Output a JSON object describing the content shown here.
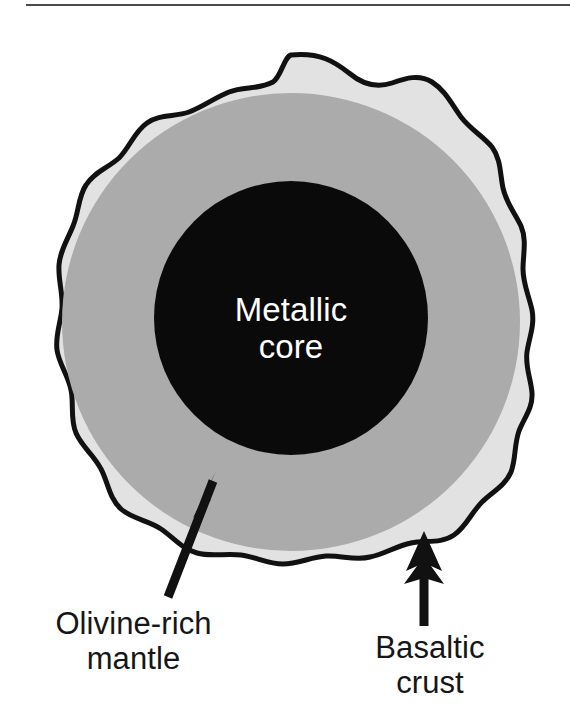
{
  "figure": {
    "kind": "cross-section-diagram",
    "background_color": "#ffffff",
    "top_rule": {
      "name": "horizontal-rule",
      "color": "#4a4a4a",
      "x": 26,
      "y": 4,
      "width": 544,
      "thickness": 2
    },
    "layers": [
      {
        "id": "crust",
        "name": "Basaltic crust",
        "fill_color": "#e2e2e2",
        "outline_color": "#111111",
        "outline_width": 5,
        "shape": "irregular-lumpy-blob",
        "order": 1
      },
      {
        "id": "mantle",
        "name": "Olivine-rich mantle",
        "fill_color": "#ababab",
        "shape": "circle",
        "center_x": 291,
        "center_y": 322,
        "radius": 229,
        "order": 2
      },
      {
        "id": "core",
        "name": "Metallic core",
        "fill_color": "#0a0a0a",
        "shape": "circle",
        "center_x": 291,
        "center_y": 318,
        "radius": 137,
        "order": 3
      }
    ],
    "labels": {
      "core": {
        "text": "Metallic\ncore",
        "line1": "Metallic",
        "line2": "core",
        "color": "#ffffff",
        "font_size": 33,
        "align": "center"
      },
      "mantle": {
        "text": "Olivine-rich\nmantle",
        "line1": "Olivine-rich",
        "line2": "mantle",
        "color": "#161616",
        "font_size": 31,
        "align": "center"
      },
      "crust": {
        "text": "Basaltic\ncrust",
        "line1": "Basaltic",
        "line2": "crust",
        "color": "#161616",
        "font_size": 31,
        "align": "center"
      }
    },
    "leader_arrows": [
      {
        "id": "arrow-mantle",
        "name": "mantle-leader-arrow",
        "points_to": "mantle",
        "color": "#111111",
        "orientation": "diagonal-up-right",
        "tail_x": 168,
        "tail_y": 597,
        "tip_x": 216,
        "tip_y": 473
      },
      {
        "id": "arrow-crust",
        "name": "crust-leader-arrow",
        "points_to": "crust",
        "color": "#111111",
        "orientation": "vertical-up",
        "tail_x": 424,
        "tail_y": 626,
        "tip_x": 424,
        "tip_y": 531
      }
    ]
  }
}
